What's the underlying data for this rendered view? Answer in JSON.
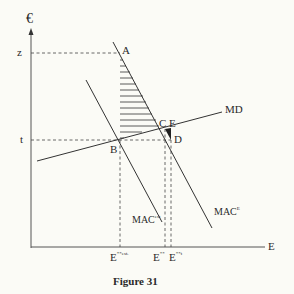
{
  "diagram": {
    "y_axis_label": "€",
    "x_axis_label": "E",
    "y_ticks": [
      {
        "label": "z"
      },
      {
        "label": "t"
      }
    ],
    "points": {
      "A": "A",
      "B": "B",
      "C": "C",
      "D": "D",
      "E": "E"
    },
    "curves": {
      "md": "MD",
      "mac_est_base": "MAC",
      "mac_est_sup": "est",
      "mac_e_base": "MAC",
      "mac_e_sup": "E"
    },
    "x_ticks": [
      {
        "base": "E",
        "sup": "**est."
      },
      {
        "base": "E",
        "sup": "**"
      },
      {
        "base": "E",
        "sup": "**t"
      }
    ],
    "colors": {
      "line": "#2f2f2f",
      "background": "#fbfbf6"
    }
  },
  "caption": "Figure 31"
}
